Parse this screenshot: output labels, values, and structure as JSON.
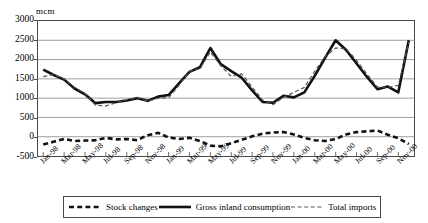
{
  "chart_data": {
    "type": "line",
    "title": "",
    "unit_label": "mcm",
    "xlabel": "",
    "ylabel": "mcm",
    "ylim": [
      -500,
      3000
    ],
    "ytick_step": 500,
    "yticks": [
      3000,
      2500,
      2000,
      1500,
      1000,
      500,
      0,
      -500
    ],
    "grid": true,
    "grid_axis": "y",
    "legend_position": "bottom",
    "x": [
      "Jan-98",
      "Feb-98",
      "Mar-98",
      "Apr-98",
      "May-98",
      "Jun-98",
      "Jul-98",
      "Aug-98",
      "Sep-98",
      "Oct-98",
      "Nov-98",
      "Dec-98",
      "Jan-99",
      "Feb-99",
      "Mar-99",
      "Apr-99",
      "May-99",
      "Jun-99",
      "Jul-99",
      "Aug-99",
      "Sep-99",
      "Oct-99",
      "Nov-99",
      "Dec-99",
      "Jan-00",
      "Feb-00",
      "Mar-00",
      "Apr-00",
      "May-00",
      "Jun-00",
      "Jul-00",
      "Aug-00",
      "Sep-00",
      "Oct-00",
      "Nov-00",
      "Dec-00"
    ],
    "xtick_labels": [
      "Jan-98",
      "Mar-98",
      "May-98",
      "Jul-98",
      "Sep-98",
      "Nov-98",
      "Jan-99",
      "Mar-99",
      "May-99",
      "Jul-99",
      "Sep-99",
      "Nov-99",
      "Jan-00",
      "Mar-00",
      "May-00",
      "Jul-00",
      "Sep-00",
      "Nov-00"
    ],
    "xtick_indices": [
      0,
      2,
      4,
      6,
      8,
      10,
      12,
      14,
      16,
      18,
      20,
      22,
      24,
      26,
      28,
      30,
      32,
      34
    ],
    "series": [
      {
        "name": "Stock changes",
        "style": "thick-dashed",
        "color": "#111111",
        "values": [
          -200,
          -130,
          -60,
          -110,
          -100,
          -90,
          -30,
          -70,
          -60,
          -90,
          40,
          100,
          -20,
          -60,
          -30,
          -110,
          -230,
          -250,
          -170,
          -80,
          10,
          80,
          110,
          120,
          60,
          -30,
          -90,
          -110,
          -60,
          60,
          120,
          140,
          160,
          50,
          -40,
          -190
        ]
      },
      {
        "name": "Gross inland consumption",
        "style": "thick-solid",
        "color": "#111111",
        "values": [
          1740,
          1600,
          1480,
          1250,
          1100,
          870,
          900,
          900,
          940,
          1000,
          930,
          1040,
          1080,
          1380,
          1680,
          1800,
          2300,
          1880,
          1700,
          1530,
          1200,
          900,
          880,
          1060,
          1020,
          1150,
          1580,
          2050,
          2500,
          2250,
          1900,
          1550,
          1230,
          1300,
          1150,
          2500
        ]
      },
      {
        "name": "Total imports",
        "style": "thin-dashed",
        "color": "#555555",
        "values": [
          1560,
          1610,
          1500,
          1280,
          1120,
          820,
          800,
          880,
          960,
          1020,
          920,
          1000,
          1010,
          1330,
          1700,
          1760,
          2200,
          1840,
          1560,
          1630,
          1290,
          950,
          830,
          1020,
          1150,
          1280,
          1700,
          2080,
          2300,
          2280,
          1980,
          1620,
          1290,
          1280,
          1330,
          2450
        ]
      }
    ]
  },
  "legend": {
    "items": [
      {
        "label": "Stock changes",
        "style": "thick-dashed"
      },
      {
        "label": "Gross inland consumption",
        "style": "thick-solid"
      },
      {
        "label": "Total imports",
        "style": "thin-dashed"
      }
    ]
  }
}
